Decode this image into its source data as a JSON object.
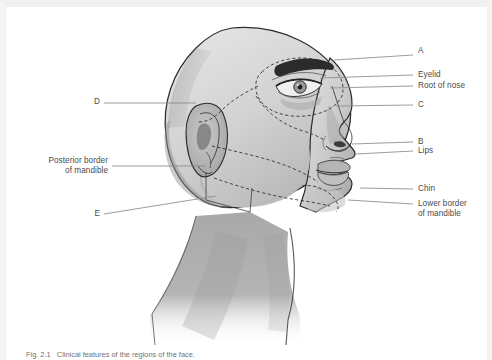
{
  "figure": {
    "caption": "Fig. 2.1   Clinical features of the regions of the face.",
    "background_color": "#ffffff",
    "line_color": "#8a8a8d",
    "text_color": "#4b4b4d",
    "skin_light": "#d9d9d9",
    "skin_mid": "#bdbdbd",
    "skin_dark": "#9a9a9a",
    "outline_color": "#2f2f2f"
  },
  "labels_right": [
    {
      "id": "A",
      "text": "A",
      "x": 418,
      "y": 51,
      "leader_x1": 334,
      "leader_y1": 60,
      "leader_x2": 413,
      "leader_y2": 55
    },
    {
      "id": "eyelid",
      "text": "Eyelid",
      "x": 418,
      "y": 71,
      "leader_x1": 320,
      "leader_y1": 78,
      "leader_x2": 413,
      "leader_y2": 75
    },
    {
      "id": "root-of-nose",
      "text": "Root of nose",
      "x": 418,
      "y": 82,
      "leader_x1": 330,
      "leader_y1": 88,
      "leader_x2": 413,
      "leader_y2": 86
    },
    {
      "id": "C",
      "text": "C",
      "x": 418,
      "y": 101,
      "leader_x1": 336,
      "leader_y1": 106,
      "leader_x2": 413,
      "leader_y2": 105
    },
    {
      "id": "B",
      "text": "B",
      "x": 418,
      "y": 138,
      "leader_x1": 352,
      "leader_y1": 144,
      "leader_x2": 413,
      "leader_y2": 142
    },
    {
      "id": "lips",
      "text": "Lips",
      "x": 418,
      "y": 147,
      "leader_x1": 356,
      "leader_y1": 154,
      "leader_x2": 413,
      "leader_y2": 151
    },
    {
      "id": "chin",
      "text": "Chin",
      "x": 418,
      "y": 185,
      "leader_x1": 360,
      "leader_y1": 188,
      "leader_x2": 413,
      "leader_y2": 189
    },
    {
      "id": "lower-border",
      "text": "Lower border\nof mandible",
      "x": 418,
      "y": 200,
      "leader_x1": 348,
      "leader_y1": 200,
      "leader_x2": 413,
      "leader_y2": 204
    }
  ],
  "labels_left": [
    {
      "id": "D",
      "text": "D",
      "x": 96,
      "y": 98,
      "leader_x1": 104,
      "leader_y1": 103,
      "leader_x2": 196,
      "leader_y2": 103
    },
    {
      "id": "posterior-border",
      "text": "Posterior border\nof mandible",
      "x": 28,
      "y": 157,
      "leader_x1": 112,
      "leader_y1": 166,
      "leader_x2": 206,
      "leader_y2": 166
    },
    {
      "id": "E",
      "text": "E",
      "x": 96,
      "y": 210,
      "leader_x1": 104,
      "leader_y1": 214,
      "leader_x2": 216,
      "leader_y2": 196
    }
  ],
  "legend_note": "Letters A-E mark unlabelled surface regions of the face"
}
